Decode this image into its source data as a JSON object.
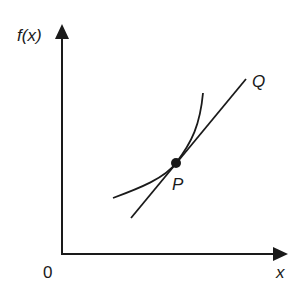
{
  "diagram": {
    "y_axis_label": "f(x)",
    "x_axis_label": "x",
    "origin_label": "0",
    "point_label": "P",
    "line_label": "Q",
    "colors": {
      "ink": "#1a1a1a",
      "background": "#ffffff"
    }
  }
}
